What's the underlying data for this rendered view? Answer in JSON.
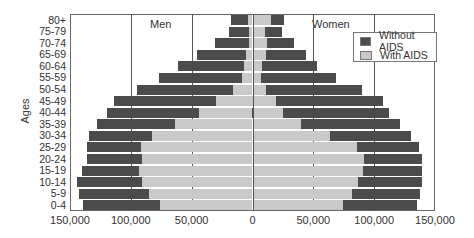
{
  "chart_data": {
    "type": "bar",
    "subtype": "population-pyramid",
    "title": "",
    "ylabel": "Ages",
    "xlabel": "",
    "side_labels": {
      "left": "Men",
      "right": "Women"
    },
    "categories": [
      "80+",
      "75-79",
      "70-74",
      "65-69",
      "60-64",
      "55-59",
      "50-54",
      "45-49",
      "40-44",
      "35-39",
      "30-34",
      "25-29",
      "20-24",
      "15-19",
      "10-14",
      "5-9",
      "0-4"
    ],
    "xlim": [
      -150000,
      150000
    ],
    "xticks": [
      "150,000",
      "100,000",
      "50,000",
      "0",
      "50,000",
      "100,000",
      "150,000"
    ],
    "xtick_values": [
      -150000,
      -100000,
      -50000,
      0,
      50000,
      100000,
      150000
    ],
    "grid": "vertical at ±100,000, ±50,000 and 0",
    "legend_position": "upper right",
    "series": [
      {
        "name": "Without AIDS",
        "color": "#4b4b4b",
        "men": [
          18000,
          19000,
          31000,
          46000,
          61000,
          77000,
          95000,
          114000,
          120000,
          128000,
          134000,
          136000,
          136000,
          140000,
          144000,
          143000,
          139000
        ],
        "women": [
          26000,
          24000,
          34000,
          44000,
          53000,
          69000,
          90000,
          107000,
          112000,
          121000,
          130000,
          137000,
          139000,
          139000,
          139000,
          138000,
          135000
        ]
      },
      {
        "name": "With AIDS",
        "color": "#c9c9c9",
        "men": [
          4000,
          3000,
          3000,
          5000,
          7000,
          9000,
          16000,
          30000,
          44000,
          64000,
          83000,
          92000,
          91000,
          93000,
          91000,
          85000,
          76000
        ],
        "women": [
          15000,
          10000,
          12000,
          11000,
          8000,
          7000,
          11000,
          19000,
          25000,
          40000,
          64000,
          86000,
          92000,
          91000,
          87000,
          82000,
          74000
        ]
      }
    ]
  },
  "legend": {
    "items": [
      {
        "label": "Without AIDS",
        "color": "#4b4b4b"
      },
      {
        "label": "With AIDS",
        "color": "#c9c9c9"
      }
    ]
  },
  "labels": {
    "men": "Men",
    "women": "Women",
    "yaxis": "Ages"
  }
}
